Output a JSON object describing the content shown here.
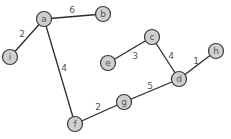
{
  "diagram": {
    "type": "weighted-undirected-graph",
    "nodes": [
      {
        "id": "a",
        "label": "a"
      },
      {
        "id": "b",
        "label": "b"
      },
      {
        "id": "i",
        "label": "i"
      },
      {
        "id": "c",
        "label": "c"
      },
      {
        "id": "e",
        "label": "e"
      },
      {
        "id": "h",
        "label": "h"
      },
      {
        "id": "d",
        "label": "d"
      },
      {
        "id": "g",
        "label": "g"
      },
      {
        "id": "f",
        "label": "f"
      }
    ],
    "edges": [
      {
        "from": "a",
        "to": "b",
        "weight": "6"
      },
      {
        "from": "a",
        "to": "i",
        "weight": "2"
      },
      {
        "from": "a",
        "to": "f",
        "weight": "4"
      },
      {
        "from": "c",
        "to": "e",
        "weight": "3"
      },
      {
        "from": "c",
        "to": "d",
        "weight": "4"
      },
      {
        "from": "d",
        "to": "h",
        "weight": "1"
      },
      {
        "from": "g",
        "to": "d",
        "weight": "5"
      },
      {
        "from": "f",
        "to": "g",
        "weight": "2"
      }
    ],
    "colors": {
      "node_fill": "#cfcfcf",
      "node_stroke": "#3a3a3a",
      "edge": "#2b2b2b",
      "text": "#555555"
    }
  }
}
